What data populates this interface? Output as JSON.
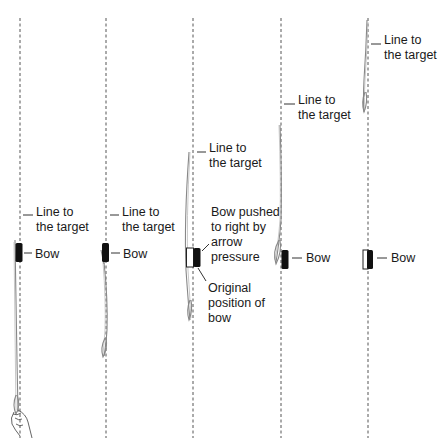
{
  "diagram": {
    "stages": [
      {
        "id": 1,
        "line_label_1": "Line to",
        "line_label_2": "the target",
        "bow_label": "Bow",
        "has_hand": true
      },
      {
        "id": 2,
        "line_label_1": "Line to",
        "line_label_2": "the target",
        "bow_label": "Bow"
      },
      {
        "id": 3,
        "line_label_1": "Line to",
        "line_label_2": "the target",
        "bow_pushed_1": "Bow pushed",
        "bow_pushed_2": "to right by",
        "bow_pushed_3": "arrow",
        "bow_pushed_4": "pressure",
        "original_1": "Original",
        "original_2": "position of",
        "original_3": "bow"
      },
      {
        "id": 4,
        "line_label_1": "Line to",
        "line_label_2": "the target",
        "bow_label": "Bow"
      },
      {
        "id": 5,
        "line_label_1": "Line to",
        "line_label_2": "the target",
        "bow_label": "Bow"
      }
    ],
    "colors": {
      "bow": "#111111",
      "dashed_line": "#555555",
      "arrow": "#888888",
      "text": "#1a1a1a"
    }
  }
}
